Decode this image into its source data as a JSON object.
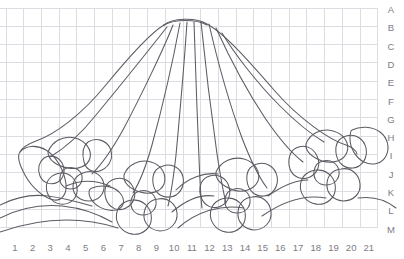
{
  "document": {
    "type": "pattern-line-drawing",
    "title": "Floral Fan Pattern Grid",
    "background_color": "#ffffff",
    "grid_color": "#dcdce2",
    "line_color": "#5b5b63",
    "label_color": "#7c7c86"
  },
  "grid": {
    "origin_x": 6,
    "origin_y": 8,
    "cell_width": 17.7,
    "cell_height": 18.3,
    "columns": 21,
    "rows": 12,
    "show_grid": true
  },
  "axes": {
    "column_labels": [
      "1",
      "2",
      "3",
      "4",
      "5",
      "6",
      "7",
      "8",
      "9",
      "10",
      "11",
      "12",
      "13",
      "14",
      "15",
      "16",
      "17",
      "18",
      "19",
      "20",
      "21"
    ],
    "row_labels": [
      "A",
      "B",
      "C",
      "D",
      "E",
      "F",
      "G",
      "H",
      "I",
      "J",
      "K",
      "L",
      "M"
    ],
    "column_axis_position": "bottom",
    "row_axis_position": "right"
  },
  "artwork": {
    "name": "floral-fan-motif",
    "description": "Outline drawing of a pleated fan or skirt shape with radiating fold lines, flanked and bordered below by five-petal flowers, leaves and trailing vine stems.",
    "elements": [
      {
        "name": "fan-body",
        "label": "Pleated fan outline"
      },
      {
        "name": "fan-pleat-lines",
        "label": "Radiating pleat folds",
        "count": 9
      },
      {
        "name": "flower-left",
        "label": "Left five-petal flower"
      },
      {
        "name": "flower-center-left",
        "label": "Lower-left five-petal flower"
      },
      {
        "name": "flower-center-right",
        "label": "Lower-right five-petal flower"
      },
      {
        "name": "flower-right",
        "label": "Right five-petal flower"
      },
      {
        "name": "leaf-far-left",
        "label": "Far left leaf"
      },
      {
        "name": "leaf-far-right",
        "label": "Far right leaf"
      },
      {
        "name": "vine-stems",
        "label": "Trailing vine stems"
      }
    ]
  }
}
